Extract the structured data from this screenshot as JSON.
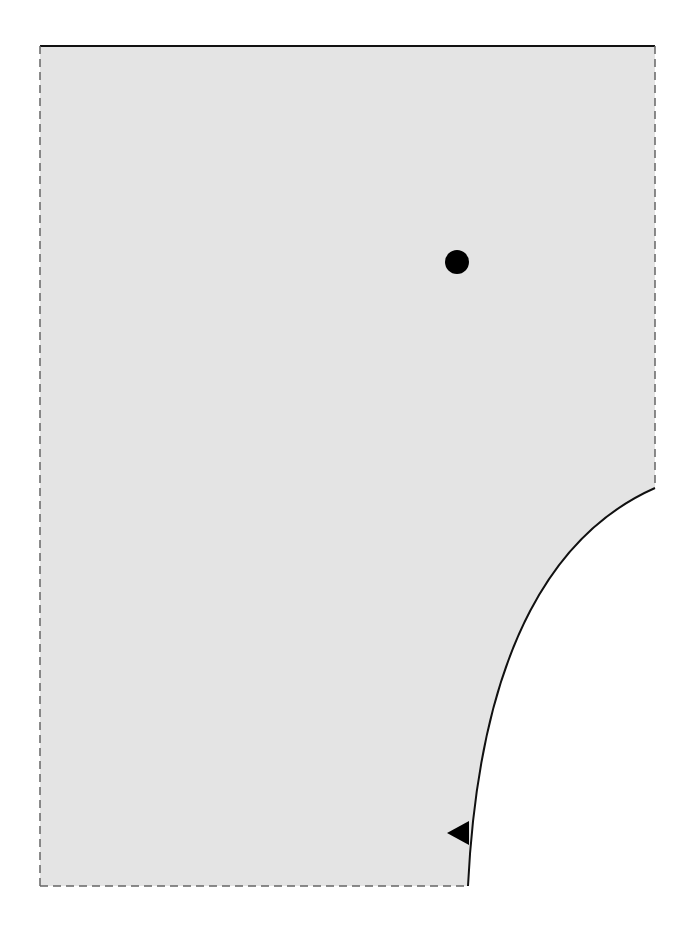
{
  "diagram": {
    "type": "geometry-region",
    "canvas": {
      "width": 699,
      "height": 926
    },
    "colors": {
      "fill": "#e4e4e4",
      "stroke": "#111111",
      "dashed": "#666666",
      "background": "#ffffff",
      "marker": "#000000"
    },
    "region": {
      "top_left": [
        40,
        46
      ],
      "top_right": [
        655,
        46
      ],
      "curve_start": [
        655,
        488
      ],
      "curve_end": [
        468,
        886
      ],
      "bottom_left": [
        40,
        886
      ],
      "top_edge": "solid",
      "left_edge": "dashed",
      "right_edge": "dashed",
      "bottom_edge": "dashed",
      "curved_edge": "solid"
    },
    "point": {
      "cx": 457,
      "cy": 262,
      "r": 12
    },
    "arrow": {
      "tip": [
        447,
        833
      ],
      "base_top": [
        469,
        821
      ],
      "base_bottom": [
        469,
        845
      ],
      "direction": "left"
    }
  }
}
